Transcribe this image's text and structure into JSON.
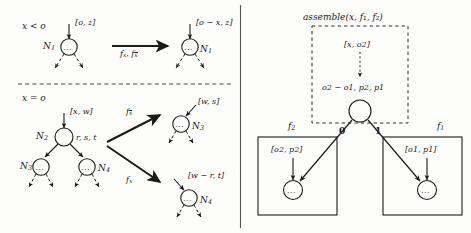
{
  "figure": {
    "panels": {
      "left": {
        "rows": [
          {
            "condition": "x < o",
            "source": {
              "node_label": "N",
              "node_sub": "1",
              "edge_label_open": "[",
              "edge_label": "o, z",
              "edge_label_close": "]",
              "node_content": "..."
            },
            "arrow_label_1": "f",
            "arrow_label_1_sub": "x",
            "arrow_label_2": "f",
            "arrow_label_2_sub": "x",
            "arrow_label_2_overline": true,
            "target": {
              "node_label": "N",
              "node_sub": "1",
              "edge_label": "[o − x, z]",
              "node_content": "..."
            }
          },
          {
            "condition": "x = o",
            "source": {
              "node_label": "N",
              "node_sub": "2",
              "edge_label": "[x, w]",
              "side_label": "r, s, t",
              "child_left_label": "N",
              "child_left_sub": "3",
              "child_right_label": "N",
              "child_right_sub": "4",
              "node_content": "..."
            },
            "branch_upper": {
              "arrow_label": "f",
              "arrow_label_sub": "x",
              "arrow_label_overline": true,
              "node_label": "N",
              "node_sub": "3",
              "edge_label": "[w, s]",
              "node_content": "..."
            },
            "branch_lower": {
              "arrow_label": "f",
              "arrow_label_sub": "x",
              "arrow_label_overline": false,
              "node_label": "N",
              "node_sub": "4",
              "edge_label": "[w − r, t]",
              "node_content": "..."
            }
          }
        ]
      },
      "right": {
        "assemble_box": {
          "title_fn": "assemble",
          "title_args": "(x, f₁, f₂)",
          "title_full": "assemble(x, f1, f2)",
          "input_edge_label": "[x, o2]",
          "node_attr_label": "o2 − o1, p2, p1",
          "node_content": ""
        },
        "low_child_box": {
          "box_label": "f",
          "box_label_sub": "2",
          "edge_label": "[o2, p2]",
          "edge_value": "0",
          "node_content": "..."
        },
        "high_child_box": {
          "box_label": "f",
          "box_label_sub": "1",
          "edge_label": "[o1, p1]",
          "edge_value": "1",
          "node_content": "..."
        }
      }
    },
    "colors": {
      "ink": "#1a1a1a",
      "paper": "#fdfdfb",
      "divider": "#555555"
    }
  }
}
